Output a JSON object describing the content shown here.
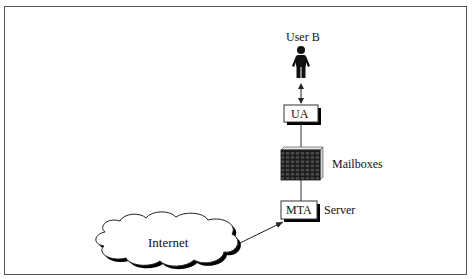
{
  "diagram": {
    "nodes": {
      "user": {
        "label": "User B",
        "icon": "person-icon"
      },
      "ua": {
        "label": "UA"
      },
      "mailboxes": {
        "label": "Mailboxes",
        "icon": "mailbox-grid-icon"
      },
      "mta": {
        "label": "MTA"
      },
      "server": {
        "label": "Server"
      },
      "internet": {
        "label": "Internet",
        "icon": "cloud-icon"
      }
    },
    "edges": [
      {
        "from": "user",
        "to": "ua",
        "type": "bidirectional-arrow"
      },
      {
        "from": "ua",
        "to": "mailboxes",
        "type": "line"
      },
      {
        "from": "mailboxes",
        "to": "mta",
        "type": "line"
      },
      {
        "from": "internet",
        "to": "mta",
        "type": "arrow"
      }
    ],
    "colors": {
      "line": "#222222",
      "shadow": "#000000",
      "box_fill": "#ffffff",
      "mailbox_fill": "#2a2a2a"
    }
  }
}
